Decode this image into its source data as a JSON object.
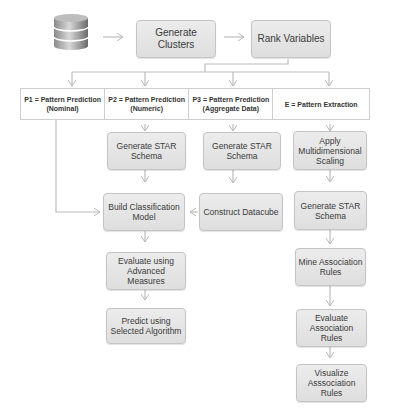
{
  "diagram": {
    "source_icon": "database-icon",
    "top_flow": [
      {
        "id": "generate-clusters",
        "label": "Generate Clusters"
      },
      {
        "id": "rank-variables",
        "label": "Rank Variables"
      }
    ],
    "columns": [
      {
        "id": "p1",
        "header": "P1 = Pattern Prediction (Nominal)"
      },
      {
        "id": "p2",
        "header": "P2 = Pattern Prediction (Numeric)"
      },
      {
        "id": "p3",
        "header": "P3 = Pattern Prediction (Aggregate Data)"
      },
      {
        "id": "e",
        "header": "E =  Pattern Extraction"
      }
    ],
    "p2_steps": [
      {
        "label": "Generate STAR Schema"
      },
      {
        "label": "Build Classification Model"
      },
      {
        "label": "Evaluate using Advanced Measures"
      },
      {
        "label": "Predict using Selected Algorithm"
      }
    ],
    "p3_steps": [
      {
        "label": "Generate STAR Schema"
      },
      {
        "label": "Construct Datacube"
      }
    ],
    "e_steps": [
      {
        "label": "Apply Multidimensional Scaling"
      },
      {
        "label": "Generate STAR Schema"
      },
      {
        "label": "Mine Association Rules"
      },
      {
        "label": "Evaluate Association Rules"
      },
      {
        "label": "Visualize Asssociation Rules"
      }
    ]
  },
  "colors": {
    "box_fill": "#e4e4e4",
    "box_border": "#c4c4c4",
    "arrow": "#b8b8b8",
    "text": "#3a3a3a"
  }
}
